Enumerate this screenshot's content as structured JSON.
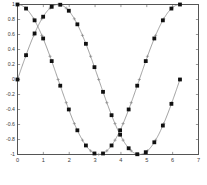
{
  "figure": {
    "caption": "",
    "background": "#ffffff",
    "axis_color": "#555555",
    "line_color": "#7a7a7a",
    "marker_color": "#111111"
  },
  "chart_data": {
    "type": "line",
    "title": "",
    "xlabel": "",
    "ylabel": "",
    "xlim": [
      0,
      7
    ],
    "ylim": [
      -1,
      1
    ],
    "grid": false,
    "legend": "none",
    "xticks": [
      0,
      1,
      2,
      3,
      4,
      5,
      6,
      7
    ],
    "xtick_labels": [
      "0",
      "1",
      "2",
      "3",
      "4",
      "5",
      "6",
      "7"
    ],
    "yticks": [
      -1,
      -0.8,
      -0.6,
      -0.4,
      -0.2,
      0,
      0.2,
      0.4,
      0.6,
      0.8,
      1
    ],
    "ytick_labels": [
      "-1",
      "-0.8",
      "-0.6",
      "-0.4",
      "-0.2",
      "0",
      "0.2",
      "0.4",
      "0.6",
      "0.8",
      "1"
    ],
    "series": [
      {
        "name": "sin(x)",
        "marker": "star-square",
        "x": [
          0,
          0.3307,
          0.6614,
          0.9921,
          1.3228,
          1.6535,
          1.9842,
          2.3149,
          2.6456,
          2.9762,
          3.3069,
          3.6376,
          3.9683,
          4.299,
          4.6297,
          4.9604,
          5.2911,
          5.6218,
          5.9525,
          6.2832
        ],
        "y": [
          0.0,
          0.3247,
          0.6142,
          0.8372,
          0.9694,
          0.9966,
          0.9168,
          0.7357,
          0.4759,
          0.1646,
          -0.1646,
          -0.4759,
          -0.7357,
          -0.9168,
          -0.9966,
          -0.9694,
          -0.8372,
          -0.6142,
          -0.3247,
          0.0
        ]
      },
      {
        "name": "cos(x)",
        "marker": "star-square",
        "x": [
          0,
          0.3307,
          0.6614,
          0.9921,
          1.3228,
          1.6535,
          1.9842,
          2.3149,
          2.6456,
          2.9762,
          3.3069,
          3.6376,
          3.9683,
          4.299,
          4.6297,
          4.9604,
          5.2911,
          5.6218,
          5.9525,
          6.2832
        ],
        "y": [
          1.0,
          0.9458,
          0.7887,
          0.5469,
          0.2455,
          -0.0825,
          -0.3993,
          -0.6773,
          -0.8795,
          -0.9864,
          -0.9864,
          -0.8795,
          -0.6773,
          -0.3993,
          -0.0825,
          0.2455,
          0.5469,
          0.7887,
          0.9458,
          1.0
        ]
      }
    ]
  }
}
